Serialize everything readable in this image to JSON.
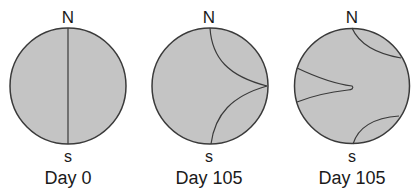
{
  "diagram": {
    "panels": [
      {
        "day_label": "Day 0",
        "north": "N",
        "south": "s"
      },
      {
        "day_label": "Day 35",
        "north": "N",
        "south": "s"
      },
      {
        "day_label": "Day 105",
        "north": "N",
        "south": "s"
      }
    ],
    "colors": {
      "fill": "#c4c4c4",
      "stroke": "#3a3a3a",
      "text": "#1a1a1a"
    }
  }
}
